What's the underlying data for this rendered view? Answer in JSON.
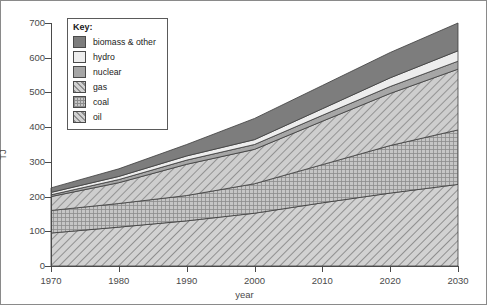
{
  "chart_data": {
    "type": "area",
    "title": "",
    "xlabel": "year",
    "ylabel": "TJ",
    "xlim": [
      1970,
      2030
    ],
    "ylim": [
      0,
      700
    ],
    "grid": false,
    "stacked": true,
    "legend_position": "top-left",
    "legend_title": "Key:",
    "x": [
      1970,
      1980,
      1990,
      2000,
      2010,
      2020,
      2030
    ],
    "xticks": [
      "1970",
      "1980",
      "1990",
      "2000",
      "2010",
      "2020",
      "2030"
    ],
    "yticks": [
      "0",
      "100",
      "200",
      "300",
      "400",
      "500",
      "600",
      "700"
    ],
    "series": [
      {
        "name": "oil",
        "pattern": "diagonal-hatch",
        "color": "#c9c9c9",
        "values": [
          95,
          112,
          130,
          152,
          182,
          210,
          235
        ],
        "cumulative": [
          95,
          112,
          130,
          152,
          182,
          210,
          235
        ]
      },
      {
        "name": "coal",
        "pattern": "crosshatch",
        "color": "#b4b4b4",
        "values": [
          65,
          68,
          73,
          85,
          110,
          137,
          157
        ],
        "cumulative": [
          160,
          180,
          203,
          237,
          292,
          347,
          392
        ]
      },
      {
        "name": "gas",
        "pattern": "diagonal-hatch",
        "color": "#c4c4c4",
        "values": [
          40,
          60,
          90,
          99,
          125,
          150,
          175
        ],
        "cumulative": [
          200,
          240,
          293,
          336,
          417,
          497,
          567
        ]
      },
      {
        "name": "nuclear",
        "pattern": "solid",
        "color": "#a0a0a0",
        "values": [
          5,
          9,
          12,
          14,
          17,
          20,
          23
        ],
        "cumulative": [
          205,
          249,
          305,
          350,
          434,
          517,
          590
        ]
      },
      {
        "name": "hydro",
        "pattern": "solid-light",
        "color": "#e6e6e6",
        "values": [
          7,
          9,
          12,
          14,
          19,
          25,
          30
        ],
        "cumulative": [
          212,
          258,
          317,
          364,
          453,
          542,
          620
        ]
      },
      {
        "name": "biomass & other",
        "pattern": "solid-dark",
        "color": "#7a7a7a",
        "values": [
          13,
          22,
          33,
          61,
          67,
          73,
          80
        ],
        "cumulative": [
          225,
          280,
          350,
          425,
          520,
          615,
          700
        ]
      }
    ],
    "legend_entries": [
      {
        "label": "biomass & other",
        "swatch": "solid-dark"
      },
      {
        "label": "hydro",
        "swatch": "solid-light"
      },
      {
        "label": "nuclear",
        "swatch": "solid"
      },
      {
        "label": "gas",
        "swatch": "diagonal-hatch"
      },
      {
        "label": "coal",
        "swatch": "crosshatch"
      },
      {
        "label": "oil",
        "swatch": "diagonal-hatch"
      }
    ]
  }
}
